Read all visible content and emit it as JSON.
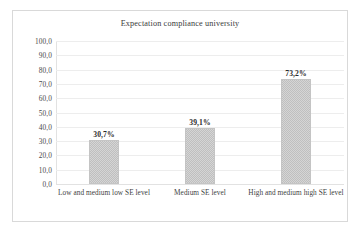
{
  "chart_data": {
    "type": "bar",
    "title": "Expectation compliance university",
    "xlabel": "",
    "ylabel": "",
    "categories": [
      "Low and medium low SE level",
      "Medium SE level",
      "High and medium high SE level"
    ],
    "values": [
      30.7,
      39.1,
      73.2
    ],
    "data_labels": [
      "30,7%",
      "39,1%",
      "73,2%"
    ],
    "ylim": [
      0,
      100
    ],
    "ytick_labels": [
      "100,0",
      "90,0",
      "80,0",
      "70,0",
      "60,0",
      "50,0",
      "40,0",
      "30,0",
      "20,0",
      "10,0",
      "0,0"
    ],
    "ytick_values": [
      100,
      90,
      80,
      70,
      60,
      50,
      40,
      30,
      20,
      10,
      0
    ],
    "grid": true,
    "legend": false,
    "legend_position": "none",
    "series": [
      {
        "name": "Expectation compliance university",
        "values": [
          30.7,
          39.1,
          73.2
        ]
      }
    ],
    "colors": {
      "bar_fill": "#d5d5d5",
      "bar_pattern": "#bfbfbf",
      "bar_border": "#c4c4c4",
      "gridline": "#ededed",
      "axis": "#e2e2e2",
      "frame_border": "#d9d9d9",
      "title_text": "#3a3a3a",
      "tick_text": "#4a4a4a",
      "label_text": "#2b2b2b",
      "background": "#ffffff"
    }
  }
}
